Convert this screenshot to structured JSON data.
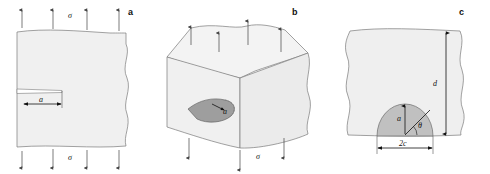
{
  "figure": {
    "type": "technical-diagram",
    "background_color": "#ffffff",
    "body_fill": "#f0f0f0",
    "flaw_fill": "#c8c8c8",
    "line_color": "#666666",
    "text_color": "#111111"
  },
  "panels": [
    {
      "id": "a",
      "label": "a",
      "description": "edge crack in plate under uniaxial tension",
      "stress_top": "σ",
      "stress_bottom": "σ",
      "crack_length_label": "a",
      "arrow_count_top": 4,
      "arrow_count_bottom": 4
    },
    {
      "id": "b",
      "label": "b",
      "description": "internal elliptical flaw in a three dimensional body under tension",
      "stress_top": "σ",
      "stress_bottom": "σ",
      "flaw_radius_label": "a",
      "arrow_count_top": 4,
      "arrow_count_bottom": 3
    },
    {
      "id": "c",
      "label": "c",
      "description": "semicircular surface flaw with depth a, width 2c, angle theta, and section thickness d",
      "depth_label": "d",
      "flaw_depth_label": "a",
      "angle_label": "θ",
      "flaw_width_label": "2c"
    }
  ]
}
